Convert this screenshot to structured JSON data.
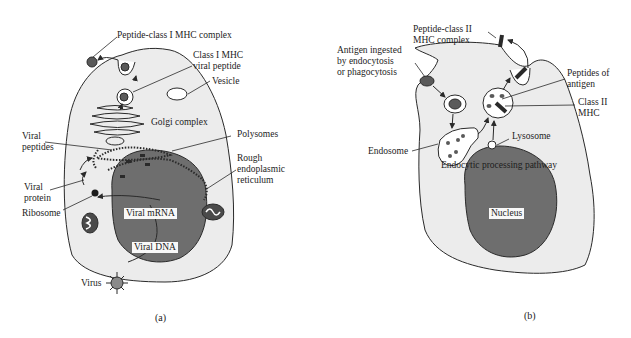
{
  "colors": {
    "background": "#ffffff",
    "cell_fill": "#ececec",
    "nucleus_fill": "#6e6e6e",
    "outline": "#2a2a2a",
    "text": "#1c1c1c"
  },
  "panel_a": {
    "caption": "(a)",
    "labels": {
      "peptide_class1_complex": "Peptide-class I MHC complex",
      "class1_viral_peptide": "Class I MHC\nviral peptide",
      "vesicle": "Vesicle",
      "golgi": "Golgi complex",
      "viral_peptides": "Viral\npeptides",
      "polysomes": "Polysomes",
      "rough_er": "Rough\nendoplasmic\nreticulum",
      "viral_protein": "Viral\nprotein",
      "ribosome": "Ribosome",
      "viral_mrna": "Viral mRNA",
      "viral_dna": "Viral DNA",
      "virus": "Virus"
    }
  },
  "panel_b": {
    "caption": "(b)",
    "labels": {
      "peptide_class2_complex": "Peptide-class II\nMHC complex",
      "antigen_ingested": "Antigen ingested\nby endocytosis\nor phagocytosis",
      "peptides_of_antigen": "Peptides of\nantigen",
      "class2_mhc": "Class II\nMHC",
      "endosome": "Endosome",
      "lysosome": "Lysosome",
      "endocytic_pathway": "Endocytic processing pathway",
      "nucleus": "Nucleus"
    }
  }
}
